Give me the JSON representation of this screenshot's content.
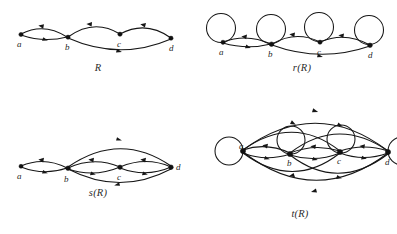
{
  "figure": {
    "background_color": "#ffffff",
    "ink_color": "#161616",
    "panel_count": 4
  },
  "panels": [
    {
      "id": "R",
      "caption": "R",
      "description": "Original relation R drawn as a directed graph",
      "vertices": [
        {
          "label": "a",
          "x": 12,
          "y": 20
        },
        {
          "label": "b",
          "x": 60,
          "y": 23
        },
        {
          "label": "c",
          "x": 112,
          "y": 20
        },
        {
          "label": "d",
          "x": 163,
          "y": 24
        }
      ],
      "edges": [
        {
          "from": "a",
          "to": "b",
          "style": "arc-up"
        },
        {
          "from": "b",
          "to": "a",
          "style": "arc-down"
        },
        {
          "from": "b",
          "to": "c",
          "style": "arc-up"
        },
        {
          "from": "c",
          "to": "d",
          "style": "arc-up"
        },
        {
          "from": "b",
          "to": "d",
          "style": "arc-deep-down"
        }
      ],
      "loops": []
    },
    {
      "id": "rR",
      "caption": "r(R)",
      "description": "Reflexive closure of R: every vertex gains a self loop",
      "vertices": [
        {
          "label": "a",
          "x": 18,
          "y": 40
        },
        {
          "label": "b",
          "x": 67,
          "y": 42
        },
        {
          "label": "c",
          "x": 115,
          "y": 40
        },
        {
          "label": "d",
          "x": 165,
          "y": 43
        }
      ],
      "edges": [
        {
          "from": "a",
          "to": "b",
          "style": "arc-up"
        },
        {
          "from": "b",
          "to": "a",
          "style": "arc-down"
        },
        {
          "from": "b",
          "to": "c",
          "style": "arc-up"
        },
        {
          "from": "c",
          "to": "d",
          "style": "arc-up"
        },
        {
          "from": "b",
          "to": "d",
          "style": "arc-deep-down"
        }
      ],
      "loops": [
        {
          "at": "a",
          "position": "top"
        },
        {
          "at": "b",
          "position": "top"
        },
        {
          "at": "c",
          "position": "top"
        },
        {
          "at": "d",
          "position": "top"
        }
      ]
    },
    {
      "id": "sR",
      "caption": "s(R)",
      "description": "Symmetric closure of R: every edge gains its reverse",
      "vertices": [
        {
          "label": "a",
          "x": 12,
          "y": 40
        },
        {
          "label": "b",
          "x": 60,
          "y": 42
        },
        {
          "label": "c",
          "x": 112,
          "y": 41
        },
        {
          "label": "d",
          "x": 163,
          "y": 41
        }
      ],
      "edges": [
        {
          "from": "a",
          "to": "b",
          "style": "arc-up"
        },
        {
          "from": "b",
          "to": "a",
          "style": "arc-down"
        },
        {
          "from": "b",
          "to": "c",
          "style": "arc-up"
        },
        {
          "from": "c",
          "to": "b",
          "style": "arc-down"
        },
        {
          "from": "c",
          "to": "d",
          "style": "arc-up"
        },
        {
          "from": "d",
          "to": "c",
          "style": "arc-down"
        },
        {
          "from": "b",
          "to": "d",
          "style": "arc-high-up"
        },
        {
          "from": "d",
          "to": "b",
          "style": "arc-deep-down"
        }
      ],
      "loops": []
    },
    {
      "id": "tR",
      "caption": "t(R)",
      "description": "Transitive closure of R: all reachability edges added",
      "vertices": [
        {
          "label": "a",
          "x": 45,
          "y": 46
        },
        {
          "label": "b",
          "x": 92,
          "y": 50
        },
        {
          "label": "c",
          "x": 142,
          "y": 48
        },
        {
          "label": "d",
          "x": 190,
          "y": 48
        }
      ],
      "edges": [
        {
          "from": "a",
          "to": "b",
          "style": "arc-up"
        },
        {
          "from": "b",
          "to": "a",
          "style": "arc-down"
        },
        {
          "from": "a",
          "to": "c",
          "style": "arc-high-up"
        },
        {
          "from": "c",
          "to": "a",
          "style": "arc-mid-down"
        },
        {
          "from": "a",
          "to": "d",
          "style": "arc-top"
        },
        {
          "from": "d",
          "to": "a",
          "style": "arc-bottom"
        },
        {
          "from": "b",
          "to": "c",
          "style": "arc-up"
        },
        {
          "from": "c",
          "to": "b",
          "style": "arc-down"
        },
        {
          "from": "b",
          "to": "d",
          "style": "arc-high-up"
        },
        {
          "from": "d",
          "to": "b",
          "style": "arc-mid-down"
        },
        {
          "from": "c",
          "to": "d",
          "style": "arc-up"
        },
        {
          "from": "d",
          "to": "c",
          "style": "arc-down"
        }
      ],
      "loops": [
        {
          "at": "a",
          "position": "left"
        },
        {
          "at": "b",
          "position": "top"
        },
        {
          "at": "c",
          "position": "top"
        },
        {
          "at": "d",
          "position": "right"
        }
      ]
    }
  ]
}
